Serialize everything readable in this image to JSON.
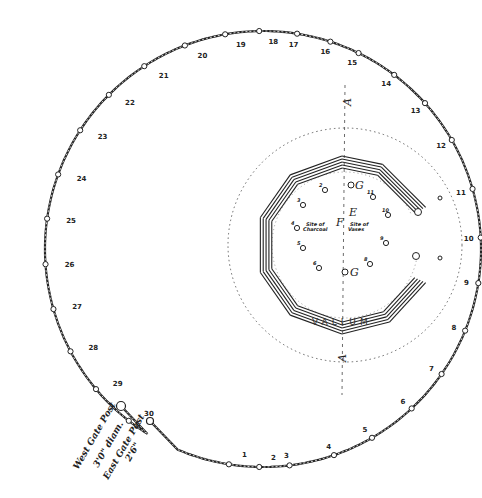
{
  "outer_ring": {
    "posts": [
      {
        "label": "1",
        "angle": 99
      },
      {
        "label": "2",
        "angle": 91
      },
      {
        "label": "3",
        "angle": 83
      },
      {
        "label": "4",
        "angle": 71
      },
      {
        "label": "5",
        "angle": 60
      },
      {
        "label": "6",
        "angle": 47
      },
      {
        "label": "7",
        "angle": 35
      },
      {
        "label": "8",
        "angle": 22
      },
      {
        "label": "9",
        "angle": 9
      },
      {
        "label": "10",
        "angle": -3
      },
      {
        "label": "11",
        "angle": -16
      },
      {
        "label": "12",
        "angle": -30
      },
      {
        "label": "13",
        "angle": -42
      },
      {
        "label": "14",
        "angle": -53
      },
      {
        "label": "15",
        "angle": -64
      },
      {
        "label": "16",
        "angle": -72
      },
      {
        "label": "17",
        "angle": -81
      },
      {
        "label": "18",
        "angle": -91
      },
      {
        "label": "19",
        "angle": -100
      },
      {
        "label": "20",
        "angle": -111
      },
      {
        "label": "21",
        "angle": -123
      },
      {
        "label": "22",
        "angle": -135
      },
      {
        "label": "23",
        "angle": -147
      },
      {
        "label": "24",
        "angle": -160
      },
      {
        "label": "25",
        "angle": -172
      },
      {
        "label": "26",
        "angle": 176
      },
      {
        "label": "27",
        "angle": 164
      },
      {
        "label": "28",
        "angle": 152
      },
      {
        "label": "29",
        "angle": 140
      },
      {
        "label": "30",
        "angle": 128
      }
    ],
    "west_gate": {
      "line1": "West Gate Post",
      "line2": "3'0\" diam."
    },
    "east_gate": {
      "line1": "East Gate Post",
      "line2": "2'6\""
    }
  },
  "inner": {
    "vallum_label": "VALLUM",
    "axis_label_top": "A",
    "axis_label_bottom": "A",
    "letters": {
      "g_top": "G",
      "g_bottom": "G",
      "e": "E",
      "f": "F"
    },
    "site_charcoal": [
      "Site of",
      "Charcoal"
    ],
    "site_vases": [
      "Site of",
      "Vases"
    ],
    "holes": [
      {
        "label": "1",
        "x": 345,
        "y": 272
      },
      {
        "label": "2",
        "x": 325,
        "y": 190
      },
      {
        "label": "3",
        "x": 303,
        "y": 205
      },
      {
        "label": "4",
        "x": 297,
        "y": 228
      },
      {
        "label": "5",
        "x": 303,
        "y": 248
      },
      {
        "label": "6",
        "x": 319,
        "y": 268
      },
      {
        "label": "8",
        "x": 370,
        "y": 264
      },
      {
        "label": "9",
        "x": 386,
        "y": 243
      },
      {
        "label": "10",
        "x": 388,
        "y": 215
      },
      {
        "label": "11",
        "x": 373,
        "y": 197
      }
    ]
  }
}
